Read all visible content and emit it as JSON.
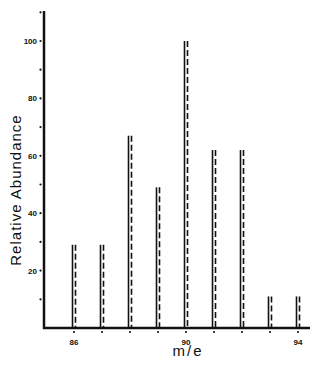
{
  "chart_data": {
    "type": "bar",
    "title": "",
    "xlabel": "m/e",
    "ylabel": "Relative Abundance",
    "categories": [
      86,
      87,
      88,
      89,
      90,
      91,
      92,
      93,
      94
    ],
    "values": [
      29,
      29,
      67,
      49,
      100,
      62,
      62,
      11,
      11
    ],
    "xlim": [
      85,
      94.4
    ],
    "ylim": [
      0,
      110
    ],
    "x_tick_labels": [
      "86",
      "90",
      "94"
    ],
    "y_tick_labels": [
      "20",
      "40",
      "60",
      "80",
      "100"
    ],
    "y_minor_ticks": [
      10,
      30,
      50,
      70,
      90,
      110
    ],
    "grid": false,
    "bar_style": "solid line with dashed line beside it",
    "legend": null
  },
  "colors": {
    "ink": "#111111",
    "background": "#ffffff"
  }
}
